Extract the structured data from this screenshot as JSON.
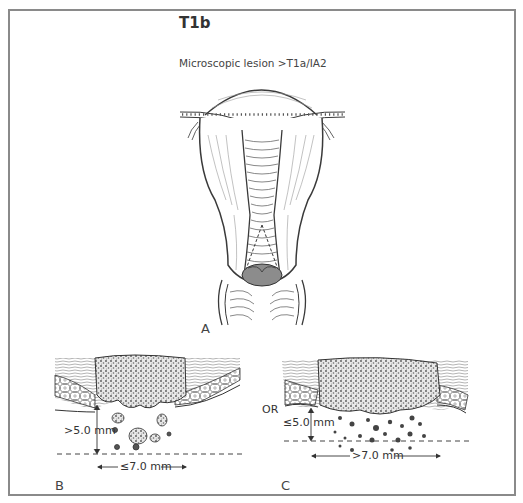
{
  "figure": {
    "title": "T1b",
    "subtitle": "Microscopic lesion >T1a/IA2",
    "connector": "OR",
    "panels": [
      {
        "id": "A",
        "label": "A",
        "description": "Uterus and cervix, frontal view, with shaded microscopic lesion at external os"
      },
      {
        "id": "B",
        "label": "B",
        "depth_label": ">5.0 mm",
        "width_label": "≤7.0 mm"
      },
      {
        "id": "C",
        "label": "C",
        "depth_label": "≤5.0 mm",
        "width_label": ">7.0 mm"
      }
    ],
    "colors": {
      "frame": "#8a8a8a",
      "line": "#3a3a3a",
      "lesion_fill": "#8c8c8c",
      "tumor_texture": "#555555"
    }
  }
}
